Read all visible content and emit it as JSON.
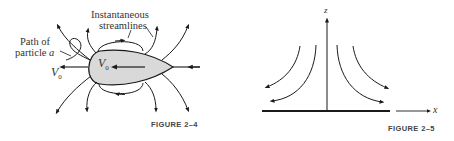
{
  "figure_2_4": {
    "caption": "FIGURE 2–4",
    "labels": {
      "streamlines_line1": "Instantaneous",
      "streamlines_line2": "streamlines",
      "path_line1": "Path of",
      "path_line2": "particle",
      "particle_name": "a",
      "velocity_outside": "V",
      "velocity_outside_sub": "0",
      "velocity_inside": "V",
      "velocity_inside_sub": "0"
    },
    "colors": {
      "body_fill": "#d9d9d9",
      "stroke": "#1a1a1a"
    }
  },
  "figure_2_5": {
    "caption": "FIGURE 2–5",
    "labels": {
      "z_axis": "z",
      "x_axis": "x"
    },
    "colors": {
      "stroke": "#1a1a1a"
    }
  }
}
